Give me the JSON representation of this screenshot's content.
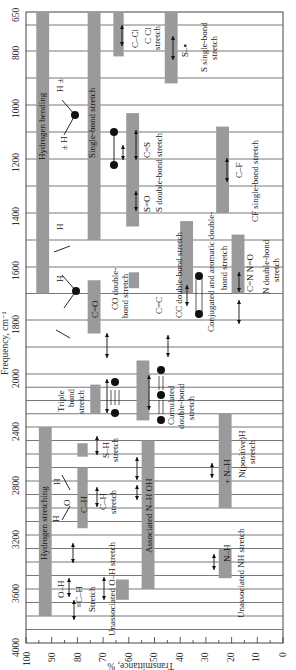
{
  "chart_data": {
    "type": "bar",
    "orientation": "frequency axis vertical (top to bottom), transmittance axis horizontal (left to right)",
    "ylabel": "Frequency, cm⁻¹",
    "xlabel": "Transmittance, %",
    "frequency_ticks": [
      650,
      800,
      1000,
      1200,
      1400,
      1600,
      1800,
      2000,
      2400,
      2800,
      3200,
      3600,
      4000
    ],
    "transmittance_ticks": [
      100,
      90,
      80,
      70,
      60,
      50,
      40,
      30,
      20,
      10,
      0
    ],
    "ylim": [
      650,
      4000
    ],
    "xlim": [
      100,
      0
    ],
    "grid": true,
    "bands": [
      {
        "label": "Hydrogen bending",
        "freq_range": [
          650,
          1700
        ],
        "transmittance": [
          96,
          91
        ],
        "description": "H± / H bending"
      },
      {
        "label": "Single-bond stretch",
        "freq_range": [
          650,
          1500
        ],
        "transmittance": [
          76,
          71
        ],
        "description": "single-bond stretch"
      },
      {
        "label": "C–Cl",
        "freq_range": [
          650,
          820
        ],
        "transmittance": [
          66,
          62
        ],
        "description": "C Cl stretch"
      },
      {
        "label": "S–▪",
        "freq_range": [
          650,
          920
        ],
        "transmittance": [
          46,
          41
        ],
        "description": "S single-bond stretch"
      },
      {
        "label": "C=S",
        "freq_range": [
          1030,
          1200
        ],
        "transmittance": [
          61,
          56
        ],
        "description": "S double-bond stretch"
      },
      {
        "label": "S=O",
        "freq_range": [
          1200,
          1450
        ],
        "transmittance": [
          61,
          56
        ],
        "description": "S double-bond stretch"
      },
      {
        "label": "C–F",
        "freq_range": [
          1080,
          1400
        ],
        "transmittance": [
          26,
          21
        ],
        "description": "CF single-bond stretch"
      },
      {
        "label": "C=O",
        "freq_range": [
          1650,
          1850
        ],
        "transmittance": [
          76,
          71
        ],
        "description": "CO double-bond stretch"
      },
      {
        "label": "C=C",
        "freq_range": [
          1620,
          1680
        ],
        "transmittance": [
          60,
          56
        ],
        "description": "CC double-bond stretch"
      },
      {
        "label": "Conjugated C=C",
        "freq_range": [
          1430,
          1700
        ],
        "transmittance": [
          40,
          35
        ],
        "description": "Conjugated and aromatic double-bond stretch"
      },
      {
        "label": "C=N N=O",
        "freq_range": [
          1480,
          1700
        ],
        "transmittance": [
          20,
          15
        ],
        "description": "N double-bond stretch"
      },
      {
        "label": "Triple bond",
        "freq_range": [
          2080,
          2300
        ],
        "transmittance": [
          75,
          71
        ],
        "description": "Triple bond stretch"
      },
      {
        "label": "Cumulated =C=",
        "freq_range": [
          1950,
          2350
        ],
        "transmittance": [
          57,
          52
        ],
        "description": "Cumulated double-bond stretch"
      },
      {
        "label": "Hydrogen stretching",
        "freq_range": [
          2400,
          3800
        ],
        "transmittance": [
          95,
          90
        ],
        "description": "Hydrogen stretching"
      },
      {
        "label": "S–H",
        "freq_range": [
          2520,
          2620
        ],
        "transmittance": [
          80,
          76
        ],
        "description": "S–H stretch"
      },
      {
        "label": "C–H",
        "freq_range": [
          2700,
          3150
        ],
        "transmittance": [
          80,
          76
        ],
        "description": "C–H stretch"
      },
      {
        "label": "Associated N–H OH",
        "freq_range": [
          2500,
          3600
        ],
        "transmittance": [
          55,
          50
        ],
        "description": "Associated N–H OH"
      },
      {
        "label": "+N–H",
        "freq_range": [
          2300,
          3000
        ],
        "transmittance": [
          25,
          20
        ],
        "description": "N(positive)H stretch"
      },
      {
        "label": "Unassociated O–H",
        "freq_range": [
          3530,
          3680
        ],
        "transmittance": [
          65,
          60
        ],
        "description": "Unassociated O–H stretch"
      },
      {
        "label": "N–H",
        "freq_range": [
          3300,
          3520
        ],
        "transmittance": [
          25,
          20
        ],
        "description": "Unassociated NH stretch"
      }
    ]
  },
  "axis": {
    "y_title": "Frequency, cm⁻¹",
    "x_title": "Transmittance, %",
    "y_ticks": [
      "650",
      "800",
      "1000",
      "1200",
      "1400",
      "1600",
      "1800",
      "2000",
      "2400",
      "2800",
      "3200",
      "3600",
      "4000"
    ],
    "x_ticks": [
      "100",
      "90",
      "80",
      "70",
      "60",
      "50",
      "40",
      "30",
      "20",
      "10",
      "0"
    ]
  },
  "labels": {
    "hydrogen_bending": "Hydrogen bending",
    "single_bond": "Single-bond stretch",
    "ccl": "C–Cl",
    "ccl_desc1": "C Cl",
    "ccl_desc2": "stretch",
    "s_single": "S–▪",
    "s_single_desc1": "S single-bond",
    "s_single_desc2": "stretch",
    "h_pm_top": "H ±",
    "h_pm_bot": "± H",
    "cs": "C=S",
    "so": "S=O",
    "s_double_desc": "S double-bond stretch",
    "cf": "C–F",
    "cf_desc": "CF single-bond stretch",
    "h1": "H",
    "h2": "H",
    "co": "C=O",
    "co_desc1": "CO double-",
    "co_desc2": "bond stretch",
    "cc": "C=C",
    "cc_desc": "CC double-bond stretch",
    "conj_desc1": "Conjugated and aromatic double-",
    "conj_desc2": "bond stretch",
    "cnno": "C=N N=O",
    "n_double_desc1": "N double-bond",
    "n_double_desc2": "stretch",
    "triple1": "Triple",
    "triple2": "bond",
    "triple3": "stretch",
    "cumul1": "Cumulated",
    "cumul2": "double-bond",
    "cumul3": "stretch",
    "sh_desc1": "S–H",
    "sh_desc2": "stretch",
    "hydrogen_stretching": "Hydrogen stretching",
    "hoh_h1": "H",
    "hoh_o": "O",
    "hoh_h2": "H",
    "ch": "C–H",
    "ch_desc1": "C–H",
    "ch_desc2": "stretch",
    "assoc": "Associated N–H OH",
    "npos": "+ N–H",
    "npos_desc1": "N(positive)H",
    "npos_desc2": "stretch",
    "oh": "O–H",
    "ech": "≡C–H",
    "ech_desc": "Stretch",
    "unassoc_oh": "Unassociated O–H stretch",
    "nh": "N–H",
    "unassoc_nh": "Unassociated  NH stretch"
  },
  "colors": {
    "band": "#9a9a9a",
    "grid": "#555555",
    "axis": "#333333",
    "marker": "#111111"
  }
}
